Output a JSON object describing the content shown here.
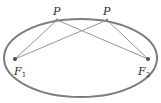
{
  "diagram": {
    "title": "",
    "type": "ellipse-foci",
    "colors": {
      "ellipse_stroke": "#7d7d7d",
      "segment_stroke": "#8a8a8a",
      "point_fill": "#4a4a4a",
      "label": "#2b2b2b"
    },
    "ellipse": {
      "cx": 80.5,
      "cy": 58,
      "rx": 76.5,
      "ry": 39
    },
    "points": [
      {
        "id": "P1",
        "label": "P",
        "x": 57,
        "y": 20
      },
      {
        "id": "P2",
        "label": "P",
        "x": 107,
        "y": 20
      }
    ],
    "foci": [
      {
        "id": "F1",
        "label": "F",
        "subscript": "1",
        "x": 15,
        "y": 59
      },
      {
        "id": "F2",
        "label": "F",
        "subscript": "2",
        "x": 148,
        "y": 59
      }
    ],
    "segments": [
      {
        "from": "F1",
        "to": "P1"
      },
      {
        "from": "P1",
        "to": "F2"
      },
      {
        "from": "F1",
        "to": "P2"
      },
      {
        "from": "P2",
        "to": "F2"
      }
    ]
  }
}
